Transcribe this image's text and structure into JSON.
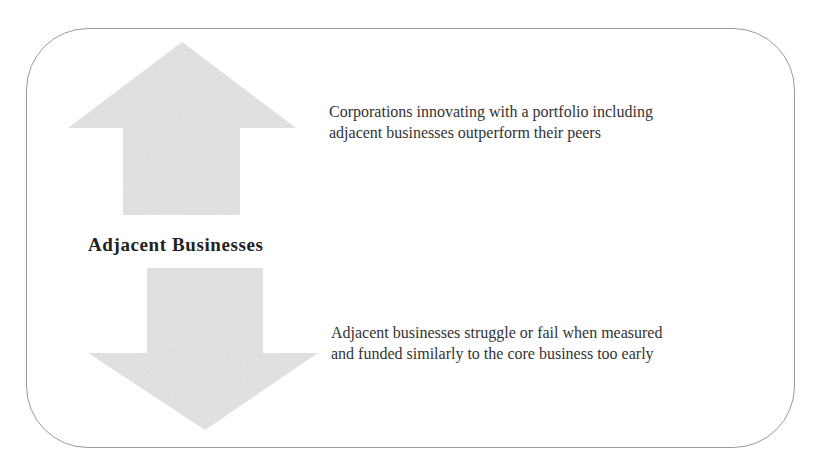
{
  "diagram": {
    "label": "Adjacent Businesses",
    "upside": {
      "icon": "arrow-up-icon",
      "lines": [
        "Corporations innovating with a portfolio including",
        "adjacent businesses outperform their peers"
      ]
    },
    "downside": {
      "icon": "arrow-down-icon",
      "lines": [
        "Adjacent businesses struggle or fail when measured",
        "and funded similarly to the core business too early"
      ]
    },
    "colors": {
      "arrow_fill": "#e3e3e3",
      "border": "#9a9a9a",
      "text": "#333333"
    }
  }
}
